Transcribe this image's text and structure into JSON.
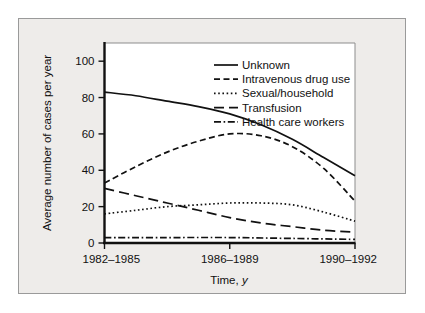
{
  "chart_data": {
    "type": "line",
    "title": "",
    "xlabel": "Time, y",
    "ylabel": "Average number of cases per year",
    "xlim": [
      0,
      2
    ],
    "ylim": [
      0,
      110
    ],
    "grid": false,
    "legend_position": "top-right",
    "categories": [
      "1982–1985",
      "1986–1989",
      "1990–1992"
    ],
    "yticks": [
      0,
      20,
      40,
      60,
      80,
      100
    ],
    "series": [
      {
        "name": "Unknown",
        "style": "solid",
        "values": [
          83,
          71,
          37
        ],
        "points": [
          [
            0,
            83
          ],
          [
            0.25,
            81
          ],
          [
            0.5,
            78
          ],
          [
            0.75,
            75
          ],
          [
            1,
            71
          ],
          [
            1.25,
            65
          ],
          [
            1.5,
            57
          ],
          [
            1.75,
            47
          ],
          [
            2,
            37
          ]
        ]
      },
      {
        "name": "Intravenous drug use",
        "style": "dashed",
        "values": [
          33,
          60,
          23
        ],
        "points": [
          [
            0,
            33
          ],
          [
            0.25,
            42
          ],
          [
            0.5,
            50
          ],
          [
            0.75,
            56
          ],
          [
            1,
            60
          ],
          [
            1.25,
            59
          ],
          [
            1.5,
            53
          ],
          [
            1.75,
            41
          ],
          [
            2,
            23
          ]
        ]
      },
      {
        "name": "Sexual/household",
        "style": "dotted",
        "values": [
          16,
          22,
          12
        ],
        "points": [
          [
            0,
            16
          ],
          [
            0.25,
            18
          ],
          [
            0.5,
            20
          ],
          [
            0.75,
            21
          ],
          [
            1,
            22
          ],
          [
            1.25,
            22
          ],
          [
            1.5,
            21
          ],
          [
            1.75,
            17
          ],
          [
            2,
            12
          ]
        ]
      },
      {
        "name": "Transfusion",
        "style": "longdash",
        "values": [
          30,
          14,
          6
        ],
        "points": [
          [
            0,
            30
          ],
          [
            0.25,
            26
          ],
          [
            0.5,
            22
          ],
          [
            0.75,
            18
          ],
          [
            1,
            14
          ],
          [
            1.25,
            11
          ],
          [
            1.5,
            9
          ],
          [
            1.75,
            7
          ],
          [
            2,
            6
          ]
        ]
      },
      {
        "name": "Health care workers",
        "style": "dashdot",
        "values": [
          3,
          3,
          2
        ],
        "points": [
          [
            0,
            3
          ],
          [
            0.5,
            3
          ],
          [
            1,
            3
          ],
          [
            1.5,
            2.5
          ],
          [
            2,
            2
          ]
        ]
      }
    ]
  },
  "legend": {
    "items": [
      {
        "label": "Unknown"
      },
      {
        "label": "Intravenous drug use"
      },
      {
        "label": "Sexual/household"
      },
      {
        "label": "Transfusion"
      },
      {
        "label": "Health care workers"
      }
    ]
  },
  "axes": {
    "y_title": "Average number of cases per year",
    "x_title_main": "Time,",
    "x_title_italic": "y",
    "ytick_labels": [
      "0",
      "20",
      "40",
      "60",
      "80",
      "100"
    ],
    "xtick_labels": [
      "1982–1985",
      "1986–1989",
      "1990–1992"
    ]
  },
  "colors": {
    "figure_background": "#eeecea",
    "plot_background": "#ffffff",
    "axis": "#111111",
    "frame": "#9a9a9a",
    "line": "#111111"
  }
}
